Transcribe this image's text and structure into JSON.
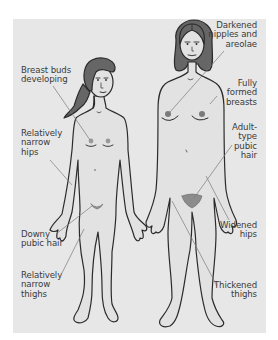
{
  "colors": {
    "panel_background": "#e7e7e7",
    "page_background": "#ffffff",
    "outline": "#2b2b2b",
    "hair": "#666666",
    "leader_line": "#7a7a7a",
    "label_text": "#3a3a3a",
    "skin": "#e2e2e2",
    "pubic_hair": "#8c8c8c"
  },
  "figures": {
    "girl": {
      "description": "Pre-pubescent girl, long hair in ponytail"
    },
    "woman": {
      "description": "Adult woman, bob-cut hair"
    }
  },
  "labels": {
    "girl": [
      {
        "id": "breast-buds",
        "lines": [
          "Breast buds",
          "developing"
        ]
      },
      {
        "id": "narrow-hips",
        "lines": [
          "Relatively",
          "narrow",
          "hips"
        ]
      },
      {
        "id": "downy-pubic-hair",
        "lines": [
          "Downy",
          "pubic hair"
        ]
      },
      {
        "id": "narrow-thighs",
        "lines": [
          "Relatively",
          "narrow",
          "thighs"
        ]
      }
    ],
    "woman": [
      {
        "id": "darkened-nipples",
        "lines": [
          "Darkened",
          "nipples and",
          "areolae"
        ]
      },
      {
        "id": "formed-breasts",
        "lines": [
          "Fully",
          "formed",
          "breasts"
        ]
      },
      {
        "id": "adult-pubic-hair",
        "lines": [
          "Adult-",
          "type",
          "pubic",
          "hair"
        ]
      },
      {
        "id": "widened-hips",
        "lines": [
          "Widened",
          "hips"
        ]
      },
      {
        "id": "thickened-thighs",
        "lines": [
          "Thickened",
          "thighs"
        ]
      }
    ]
  }
}
